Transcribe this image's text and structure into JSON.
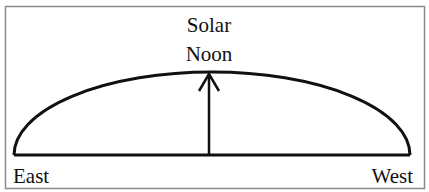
{
  "diagram": {
    "title_line1": "Solar",
    "title_line2": "Noon",
    "left_label": "East",
    "right_label": "West"
  },
  "style": {
    "frame_color": "#8a8a8a",
    "line_color": "#111111",
    "background": "#ffffff"
  }
}
